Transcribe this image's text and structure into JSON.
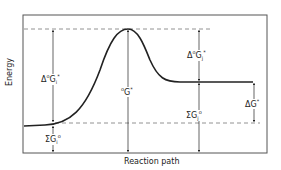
{
  "diagram": {
    "type": "reaction-energy-profile",
    "y_axis_label": "Energy",
    "x_axis_label": "Reaction path",
    "labels": {
      "activation_forward": {
        "prefix": "Δ",
        "sup_pre": "o",
        "main": "G",
        "sub": "i",
        "sup": "*"
      },
      "transition_state": {
        "sup_pre": "o",
        "main": "G",
        "sup": "*"
      },
      "activation_reverse": {
        "prefix": "Δ",
        "sup_pre": "o",
        "main": "G",
        "sub": "j",
        "sup": "*"
      },
      "reactants_sum": {
        "prefix": "Σ",
        "main": "G",
        "sub": "i",
        "sup": "o"
      },
      "products_sum": {
        "prefix": "Σ",
        "main": "G",
        "sub": "j",
        "sup": "o"
      },
      "reaction_free_energy": {
        "prefix": "Δ",
        "main": "G",
        "sup": "*"
      }
    },
    "colors": {
      "line": "#222222",
      "frame": "#555555",
      "dashed": "#777777"
    }
  }
}
